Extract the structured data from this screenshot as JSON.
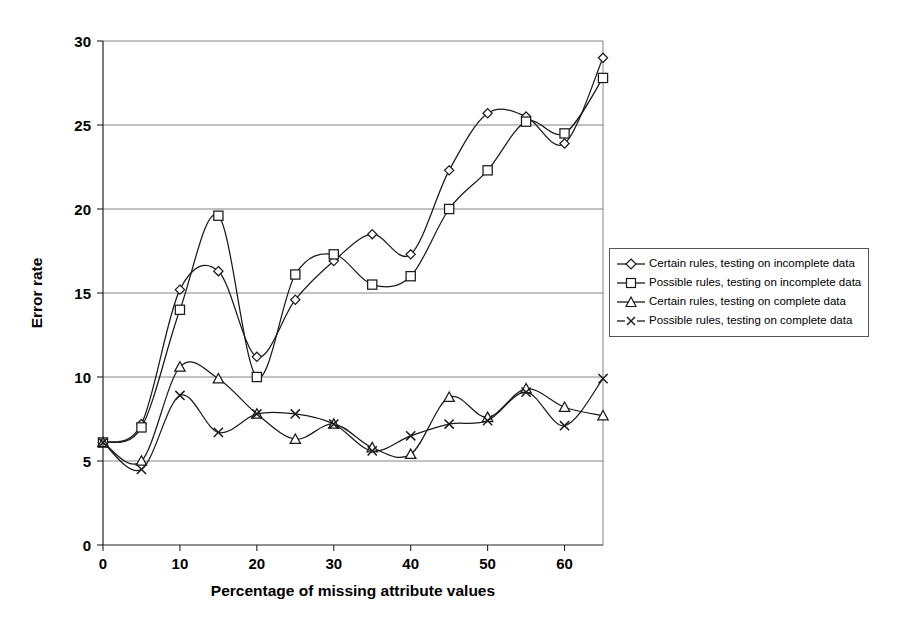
{
  "chart_data": {
    "type": "line",
    "title": "",
    "xlabel": "Percentage of missing attribute values",
    "ylabel": "Error rate",
    "xlim": [
      0,
      65
    ],
    "ylim": [
      0,
      30
    ],
    "xticks": [
      0,
      10,
      20,
      30,
      40,
      50,
      60
    ],
    "yticks": [
      0,
      5,
      10,
      15,
      20,
      25,
      30
    ],
    "xticklabels": [
      "0",
      "10",
      "20",
      "30",
      "40",
      "50",
      "60"
    ],
    "yticklabels": [
      "0",
      "5",
      "10",
      "15",
      "20",
      "25",
      "30"
    ],
    "grid": "horizontal",
    "legend_position": "right",
    "x": [
      0,
      5,
      10,
      15,
      20,
      25,
      30,
      35,
      40,
      45,
      50,
      55,
      60,
      65
    ],
    "series": [
      {
        "name": "Certain rules, testing on incomplete data",
        "marker": "diamond",
        "values": [
          6.1,
          7.2,
          15.2,
          16.3,
          11.2,
          14.6,
          16.9,
          18.5,
          17.3,
          22.3,
          25.7,
          25.5,
          23.9,
          29.0
        ]
      },
      {
        "name": "Possible rules, testing on incomplete data",
        "marker": "square",
        "values": [
          6.1,
          7.0,
          14.0,
          19.6,
          10.0,
          16.1,
          17.3,
          15.5,
          16.0,
          20.0,
          22.3,
          25.2,
          24.5,
          27.8
        ]
      },
      {
        "name": "Certain rules, testing on complete data",
        "marker": "triangle",
        "values": [
          6.1,
          5.0,
          10.6,
          9.9,
          7.8,
          6.3,
          7.2,
          5.8,
          5.4,
          8.8,
          7.6,
          9.3,
          8.2,
          7.7
        ]
      },
      {
        "name": "Possible rules, testing on complete data",
        "marker": "cross",
        "values": [
          6.1,
          4.5,
          8.9,
          6.7,
          7.8,
          7.8,
          7.2,
          5.6,
          6.5,
          7.2,
          7.4,
          9.1,
          7.1,
          9.9
        ]
      }
    ]
  },
  "legend": {
    "items": [
      {
        "label": "Certain rules, testing on incomplete data",
        "marker": "diamond"
      },
      {
        "label": "Possible rules, testing on incomplete data",
        "marker": "square"
      },
      {
        "label": "Certain rules, testing on complete data",
        "marker": "triangle"
      },
      {
        "label": "Possible rules, testing on complete data",
        "marker": "cross"
      }
    ]
  },
  "colors": {
    "line": "#1a1a1a",
    "grid": "#777777",
    "axis": "#222222",
    "background": "#ffffff"
  }
}
